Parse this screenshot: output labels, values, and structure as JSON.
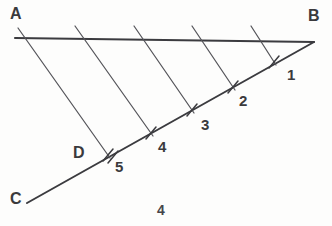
{
  "figure": {
    "page_number": "4",
    "background_color": "#fdfdfc",
    "stroke_color": "#3b3b3f",
    "label_color": "#3a3a3c",
    "vertices": [
      {
        "name": "A",
        "label": "A",
        "x": 15,
        "y": 38,
        "label_x": 10,
        "label_y": 6
      },
      {
        "name": "B",
        "label": "B",
        "x": 314,
        "y": 42,
        "label_x": 309,
        "label_y": 8
      },
      {
        "name": "C",
        "label": "C",
        "x": 27,
        "y": 203,
        "label_x": 10,
        "label_y": 191
      },
      {
        "name": "D",
        "label": "D",
        "x": 108,
        "y": 155,
        "label_x": 73,
        "label_y": 145
      }
    ],
    "edges": [
      {
        "name": "segment-ab",
        "from": "A",
        "to": "B",
        "x1": 15,
        "y1": 38,
        "x2": 314,
        "y2": 42
      },
      {
        "name": "segment-cb",
        "from": "C",
        "to": "B",
        "x1": 27,
        "y1": 203,
        "x2": 314,
        "y2": 42
      }
    ],
    "division_points": [
      {
        "label": "1",
        "x": 274,
        "y": 62,
        "label_x": 287,
        "label_y": 66
      },
      {
        "label": "2",
        "x": 233,
        "y": 87,
        "label_x": 239,
        "label_y": 92
      },
      {
        "label": "3",
        "x": 192,
        "y": 110,
        "label_x": 200,
        "label_y": 116
      },
      {
        "label": "4",
        "x": 151,
        "y": 133,
        "label_x": 157,
        "label_y": 138
      },
      {
        "label": "5",
        "x": 108,
        "y": 155,
        "label_x": 114,
        "label_y": 158
      }
    ],
    "parallel_lines": [
      {
        "name": "parallel-line-1",
        "x1": 18,
        "y1": 28,
        "x2": 108,
        "y2": 155
      },
      {
        "name": "parallel-line-2",
        "x1": 78,
        "y1": 28,
        "x2": 151,
        "y2": 133
      },
      {
        "name": "parallel-line-3",
        "x1": 136,
        "y1": 28,
        "x2": 192,
        "y2": 110
      },
      {
        "name": "parallel-line-4",
        "x1": 194,
        "y1": 28,
        "x2": 233,
        "y2": 87
      },
      {
        "name": "parallel-line-5",
        "x1": 253,
        "y1": 28,
        "x2": 274,
        "y2": 62
      }
    ]
  }
}
